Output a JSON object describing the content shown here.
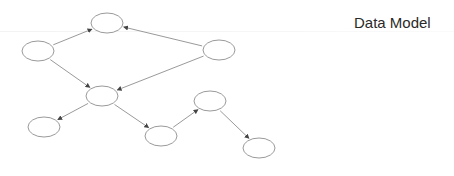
{
  "title": "Data Model",
  "colors": {
    "stroke": "#9a9a9a",
    "text": "#2a2a2a",
    "background": "#ffffff"
  },
  "nodes": [
    {
      "id": "n1",
      "cx": 107,
      "cy": 23,
      "rx": 16,
      "ry": 10
    },
    {
      "id": "n2",
      "cx": 38,
      "cy": 51,
      "rx": 16,
      "ry": 10
    },
    {
      "id": "n3",
      "cx": 219,
      "cy": 50,
      "rx": 16,
      "ry": 10
    },
    {
      "id": "n4",
      "cx": 102,
      "cy": 96,
      "rx": 16,
      "ry": 10
    },
    {
      "id": "n5",
      "cx": 44,
      "cy": 127,
      "rx": 16,
      "ry": 10
    },
    {
      "id": "n6",
      "cx": 161,
      "cy": 136,
      "rx": 16,
      "ry": 10
    },
    {
      "id": "n7",
      "cx": 210,
      "cy": 101,
      "rx": 16,
      "ry": 10
    },
    {
      "id": "n8",
      "cx": 259,
      "cy": 148,
      "rx": 16,
      "ry": 10
    }
  ],
  "edges": [
    {
      "from": "n2",
      "to": "n1"
    },
    {
      "from": "n3",
      "to": "n1"
    },
    {
      "from": "n2",
      "to": "n4"
    },
    {
      "from": "n3",
      "to": "n4"
    },
    {
      "from": "n4",
      "to": "n5"
    },
    {
      "from": "n4",
      "to": "n6"
    },
    {
      "from": "n6",
      "to": "n7"
    },
    {
      "from": "n7",
      "to": "n8"
    }
  ]
}
